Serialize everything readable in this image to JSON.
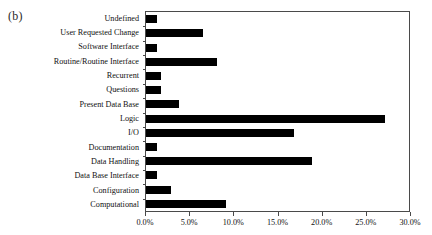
{
  "figure": {
    "panel_label": "(b)",
    "background_color": "#ffffff",
    "bar_color": "#000000",
    "axis_color": "#4a4a4a"
  },
  "chart_data": {
    "type": "bar",
    "orientation": "horizontal",
    "title": "",
    "subtitle": "",
    "xlabel": "",
    "ylabel": "",
    "xlim": [
      0.0,
      30.0
    ],
    "xtick_labels": [
      "0.0%",
      "5.0%",
      "10.0%",
      "15.0%",
      "20.0%",
      "25.0%",
      "30.0%"
    ],
    "xtick_values": [
      0.0,
      5.0,
      10.0,
      15.0,
      20.0,
      25.0,
      30.0
    ],
    "grid": false,
    "legend": null,
    "value_unit": "%",
    "categories": [
      "Undefined",
      "User Requested Change",
      "Software Interface",
      "Routine/Routine Interface",
      "Recurrent",
      "Questions",
      "Present Data Base",
      "Logic",
      "I/O",
      "Documentation",
      "Data Handling",
      "Data Base Interface",
      "Configuration",
      "Computational"
    ],
    "values": [
      1.2,
      6.5,
      1.2,
      8.0,
      1.7,
      1.7,
      3.7,
      27.0,
      16.8,
      1.2,
      18.8,
      1.2,
      2.8,
      9.1
    ]
  }
}
